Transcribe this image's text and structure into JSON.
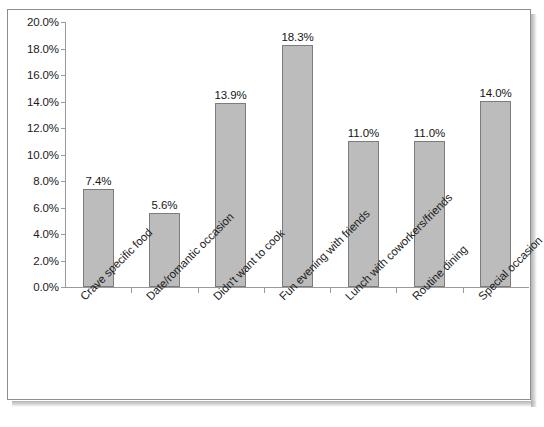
{
  "chart_data": {
    "type": "bar",
    "title": "",
    "subtitle": "",
    "xlabel": "",
    "ylabel": "",
    "categories": [
      "Crave specific food",
      "Date/romantic occasion",
      "Didn't want to cook",
      "Fun evening with friends",
      "Lunch with  coworkers/friends",
      "Routine dining",
      "Special occasion"
    ],
    "values": [
      7.4,
      5.6,
      13.9,
      18.3,
      11.0,
      11.0,
      14.0
    ],
    "data_labels": [
      "7.4%",
      "5.6%",
      "13.9%",
      "18.3%",
      "11.0%",
      "11.0%",
      "14.0%"
    ],
    "ylim": [
      0,
      20
    ],
    "ytick_step": 2,
    "ytick_labels": [
      "0.0%",
      "2.0%",
      "4.0%",
      "6.0%",
      "8.0%",
      "10.0%",
      "12.0%",
      "14.0%",
      "16.0%",
      "18.0%",
      "20.0%"
    ],
    "ytick_values": [
      0,
      2,
      4,
      6,
      8,
      10,
      12,
      14,
      16,
      18,
      20
    ],
    "grid": false,
    "legend": false,
    "legend_position": "none",
    "series": [
      {
        "name": "",
        "values": [
          7.4,
          5.6,
          13.9,
          18.3,
          11.0,
          11.0,
          14.0
        ]
      }
    ],
    "colors": {
      "bar_fill": "#bcbcbc",
      "bar_border": "#7c7c7c",
      "axis": "#9a9a9a",
      "text": "#1b1b1b",
      "frame": "#8d8d8d",
      "background": "#ffffff"
    }
  }
}
